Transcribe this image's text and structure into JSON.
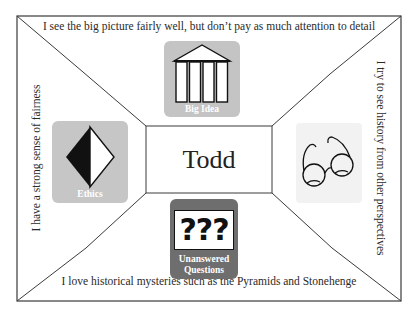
{
  "diagram": {
    "center": {
      "name": "Todd"
    },
    "sides": {
      "top": "I see the big picture fairly well, but don’t pay as much attention to detail",
      "bottom": "I love historical mysteries such as the Pyramids and Stonehenge",
      "left": "I have a strong sense of fairness",
      "right": "I try to see history from other perspectives"
    },
    "tiles": {
      "big_idea": {
        "caption": "Big Idea",
        "icon": "temple-icon",
        "color": "#c4c4c4"
      },
      "ethics": {
        "caption": "Ethics",
        "icon": "half-diamond-icon",
        "color": "#c6c6c6"
      },
      "perspectives": {
        "caption": "",
        "icon": "glasses-icon",
        "color": "#f2f2f2"
      },
      "questions": {
        "caption_line1": "Unanswered",
        "caption_line2": "Questions",
        "icon": "question-marks-icon",
        "symbol": "???",
        "color": "#6e6e6e"
      }
    },
    "colors": {
      "line": "#3a3a3a",
      "background": "#ffffff"
    }
  }
}
